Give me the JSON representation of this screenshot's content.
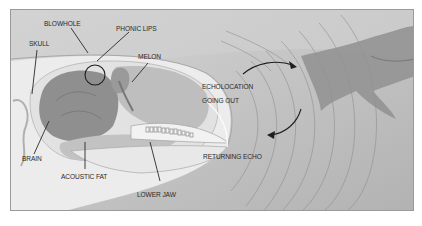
{
  "diagram": {
    "labels": {
      "blowhole": "BLOWHOLE",
      "phonic_lips": "PHONIC LIPS",
      "skull": "SKULL",
      "melon": "MELON",
      "echolocation_line1": "ECHOLOCATION",
      "echolocation_line2": "GOING OUT",
      "brain": "BRAIN",
      "acoustic_fat": "ACOUSTIC FAT",
      "lower_jaw": "LOWER JAW",
      "returning_echo": "RETURNING ECHO"
    },
    "colors": {
      "background_water": "#bdbdbd",
      "head_light": "#e4e4e4",
      "brain": "#8f8f8f",
      "melon": "#b0b0b0",
      "fish": "#8a8a8a",
      "lines": "#2a2a2a",
      "frame_border": "#9a9a9a"
    }
  }
}
